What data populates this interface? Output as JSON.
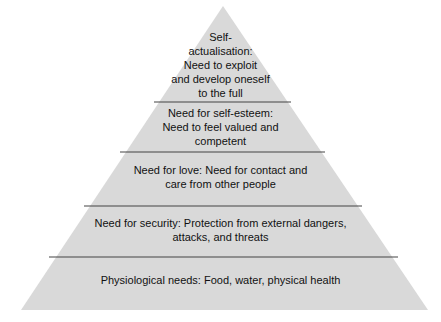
{
  "diagram": {
    "type": "pyramid",
    "fill_color": "#d9d9d9",
    "divider_color": "#444444",
    "levels": [
      {
        "name": "self-actualisation",
        "lines": [
          "Self-",
          "actualisation:",
          "Need to exploit",
          "and develop oneself",
          "to the full"
        ]
      },
      {
        "name": "self-esteem",
        "lines": [
          "Need for self-esteem:",
          "Need to feel valued and",
          "competent"
        ]
      },
      {
        "name": "love",
        "lines": [
          "Need for love: Need for contact and",
          "care from other people"
        ]
      },
      {
        "name": "security",
        "lines": [
          "Need for security: Protection from external dangers,",
          "attacks, and threats"
        ]
      },
      {
        "name": "physiological",
        "lines": [
          "Physiological needs: Food, water, physical health"
        ]
      }
    ]
  }
}
